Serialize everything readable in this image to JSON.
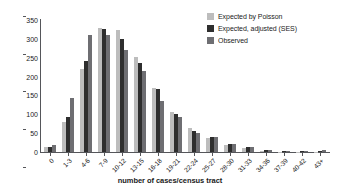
{
  "chart_data": {
    "type": "bar",
    "title": "",
    "xlabel": "number of cases/census tract",
    "ylabel": "number of census tracts",
    "ylim": [
      0,
      350
    ],
    "yticks": [
      0,
      50,
      100,
      150,
      200,
      250,
      300,
      350
    ],
    "grid": false,
    "legend_position": "top-right",
    "categories": [
      "0",
      "1-3",
      "4-6",
      "7-9",
      "10-12",
      "13-15",
      "16-18",
      "19-21",
      "22-24",
      "25-27",
      "28-30",
      "31-33",
      "34-36",
      "37-39",
      "40-42",
      "43+"
    ],
    "series": [
      {
        "name": "Expected by Poisson",
        "color": "#bdbdbd",
        "values": [
          13,
          79,
          221,
          328,
          323,
          252,
          170,
          105,
          65,
          36,
          19,
          11,
          4,
          1,
          1,
          1
        ]
      },
      {
        "name": "Expected, adjusted (SES)",
        "color": "#2e2e2e",
        "values": [
          14,
          94,
          241,
          325,
          299,
          236,
          166,
          102,
          57,
          39,
          21,
          12,
          5,
          2,
          2,
          2
        ]
      },
      {
        "name": "Observed",
        "color": "#6e6e72",
        "values": [
          18,
          144,
          310,
          310,
          270,
          214,
          134,
          93,
          50,
          39,
          22,
          12,
          5,
          2,
          3,
          5
        ]
      }
    ]
  },
  "legend": {
    "items": [
      {
        "label": "Expected by Poisson"
      },
      {
        "label": "Expected, adjusted (SES)"
      },
      {
        "label": "Observed"
      }
    ]
  }
}
